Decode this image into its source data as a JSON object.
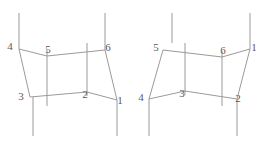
{
  "figure": {
    "background_color": "#ffffff",
    "line_color": "#9a9a9a",
    "label_color": "#5a5a5a",
    "diagrams": [
      {
        "id": "left-diagram",
        "name": "left-lattice-diagram",
        "nodes": [
          {
            "id": "L1",
            "label": "1",
            "x": 117,
            "y": 100,
            "label_x": 120,
            "label_y": 101
          },
          {
            "id": "L2",
            "label": "2",
            "x": 87,
            "y": 92,
            "label_x": 85,
            "label_y": 95
          },
          {
            "id": "L3",
            "label": "3",
            "x": 30,
            "y": 97,
            "label_x": 21,
            "label_y": 97
          },
          {
            "id": "L4",
            "label": "4",
            "x": 19,
            "y": 49,
            "label_x": 10,
            "label_y": 47
          },
          {
            "id": "L5",
            "label": "5",
            "x": 47,
            "y": 56,
            "label_x": 48,
            "label_y": 50
          },
          {
            "id": "L6",
            "label": "6",
            "x": 105,
            "y": 50,
            "label_x": 108,
            "label_y": 48
          }
        ],
        "edges": [
          {
            "name": "edge-4-5",
            "x1": 19,
            "y1": 49,
            "x2": 47,
            "y2": 56
          },
          {
            "name": "edge-5-6",
            "x1": 47,
            "y1": 56,
            "x2": 105,
            "y2": 50
          },
          {
            "name": "edge-3-2",
            "x1": 30,
            "y1": 97,
            "x2": 87,
            "y2": 92
          },
          {
            "name": "edge-2-1",
            "x1": 87,
            "y1": 92,
            "x2": 117,
            "y2": 100
          },
          {
            "name": "edge-4-3",
            "x1": 19,
            "y1": 49,
            "x2": 30,
            "y2": 97
          },
          {
            "name": "edge-6-1",
            "x1": 105,
            "y1": 50,
            "x2": 117,
            "y2": 100
          },
          {
            "name": "edge-5-vertical",
            "x1": 47,
            "y1": 50,
            "x2": 47,
            "y2": 106
          },
          {
            "name": "edge-2-vertical",
            "x1": 87,
            "y1": 43,
            "x2": 87,
            "y2": 96
          },
          {
            "name": "leg-top-4",
            "x1": 19,
            "y1": 13,
            "x2": 19,
            "y2": 49
          },
          {
            "name": "leg-top-6",
            "x1": 105,
            "y1": 13,
            "x2": 105,
            "y2": 50
          },
          {
            "name": "leg-bottom-3",
            "x1": 33,
            "y1": 97,
            "x2": 33,
            "y2": 136
          },
          {
            "name": "leg-bottom-1",
            "x1": 117,
            "y1": 100,
            "x2": 117,
            "y2": 136
          }
        ]
      },
      {
        "id": "right-diagram",
        "name": "right-lattice-diagram",
        "nodes": [
          {
            "id": "R1",
            "label": "1",
            "x": 250,
            "y": 49,
            "label_x": 254,
            "label_y": 48
          },
          {
            "id": "R2",
            "label": "2",
            "x": 237,
            "y": 99,
            "label_x": 238,
            "label_y": 99
          },
          {
            "id": "R3",
            "label": "3",
            "x": 185,
            "y": 91,
            "label_x": 182,
            "label_y": 94
          },
          {
            "id": "R4",
            "label": "4",
            "x": 149,
            "y": 99,
            "label_x": 141,
            "label_y": 98
          },
          {
            "id": "R5",
            "label": "5",
            "x": 163,
            "y": 50,
            "label_x": 156,
            "label_y": 48
          },
          {
            "id": "R6",
            "label": "6",
            "x": 222,
            "y": 57,
            "label_x": 223,
            "label_y": 51
          }
        ],
        "edges": [
          {
            "name": "edge-5-6",
            "x1": 163,
            "y1": 50,
            "x2": 222,
            "y2": 57
          },
          {
            "name": "edge-6-1",
            "x1": 222,
            "y1": 57,
            "x2": 250,
            "y2": 49
          },
          {
            "name": "edge-4-3",
            "x1": 149,
            "y1": 99,
            "x2": 185,
            "y2": 91
          },
          {
            "name": "edge-3-2",
            "x1": 185,
            "y1": 91,
            "x2": 237,
            "y2": 99
          },
          {
            "name": "edge-5-4",
            "x1": 163,
            "y1": 50,
            "x2": 149,
            "y2": 99
          },
          {
            "name": "edge-1-2",
            "x1": 250,
            "y1": 49,
            "x2": 237,
            "y2": 99
          },
          {
            "name": "edge-3-vertical",
            "x1": 185,
            "y1": 43,
            "x2": 185,
            "y2": 95
          },
          {
            "name": "edge-6-vertical",
            "x1": 222,
            "y1": 51,
            "x2": 222,
            "y2": 106
          },
          {
            "name": "leg-top-5",
            "x1": 172,
            "y1": 13,
            "x2": 172,
            "y2": 43
          },
          {
            "name": "leg-top-1",
            "x1": 250,
            "y1": 13,
            "x2": 250,
            "y2": 49
          },
          {
            "name": "leg-bottom-4",
            "x1": 149,
            "y1": 99,
            "x2": 149,
            "y2": 136
          },
          {
            "name": "leg-bottom-2",
            "x1": 237,
            "y1": 99,
            "x2": 237,
            "y2": 136
          }
        ]
      }
    ]
  }
}
